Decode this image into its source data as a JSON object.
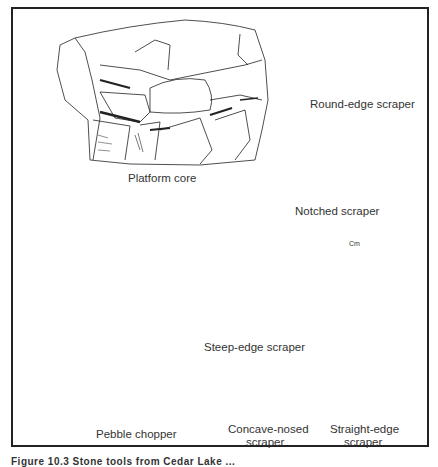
{
  "figure": {
    "items": [
      {
        "id": "platform-core",
        "label": "Platform core"
      },
      {
        "id": "round-edge-scraper",
        "label": "Round-edge scraper"
      },
      {
        "id": "notched-scraper",
        "label": "Notched scraper"
      },
      {
        "id": "pebble-chopper",
        "label": "Pebble chopper"
      },
      {
        "id": "steep-edge-scraper",
        "label": "Steep-edge scraper"
      },
      {
        "id": "concave-nosed-scraper",
        "label_line1": "Concave-nosed",
        "label_line2": "scraper"
      },
      {
        "id": "straight-edge-scraper",
        "label_line1": "Straight-edge",
        "label_line2": "scraper"
      }
    ],
    "scale_bar": {
      "unit_label": "Cm"
    },
    "caption_fragment": "Figure 10.3 Stone tools from Cedar Lake ..."
  },
  "colors": {
    "ink": "#222222",
    "background": "#ffffff",
    "stipple": "#9a9a9a"
  }
}
